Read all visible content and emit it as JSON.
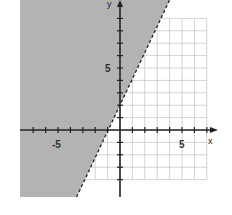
{
  "chart_data": {
    "type": "line",
    "title": "",
    "subtitle": "",
    "xlabel": "x",
    "ylabel": "y",
    "xlim": [
      -8,
      7
    ],
    "ylim": [
      -5,
      10
    ],
    "grid": true,
    "legend": null,
    "x_tick_labels": [
      {
        "value": -5,
        "label": "-5"
      },
      {
        "value": 5,
        "label": "5"
      }
    ],
    "y_tick_labels": [
      {
        "value": 5,
        "label": "5"
      }
    ],
    "series": [
      {
        "name": "boundary y = 2x + 2",
        "style": "dashed",
        "equation": "y = 2x + 2",
        "x": [
          -3.5,
          4
        ],
        "y": [
          -5,
          10
        ]
      }
    ],
    "shaded_region": {
      "description": "region above/left of dashed line (strict inequality)",
      "inequality": "y > 2x + 2",
      "color": "#b3b3b3"
    }
  },
  "colors": {
    "shade": "#b3b3b3",
    "axis": "#222222",
    "grid": "#c8c8c8",
    "boundary": "#222222",
    "background": "#ffffff"
  },
  "labels": {
    "x_axis": "x",
    "y_axis": "y",
    "x_neg5": "-5",
    "x_pos5": "5",
    "y_pos5": "5"
  }
}
